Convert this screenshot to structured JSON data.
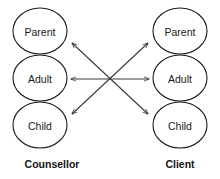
{
  "diagram": {
    "type": "transactional-analysis-ego-state-diagram",
    "background_color": "#ffffff",
    "stroke_color": "#1a1a1a",
    "arrow_color": "#3a3a3a",
    "text_color": "#1a1a1a",
    "parties": [
      {
        "id": "counsellor",
        "label": "Counsellor",
        "label_x": 52,
        "label_y": 164,
        "center_x": 40,
        "ego_states": [
          {
            "id": "counsellor-parent",
            "label": "Parent",
            "cx": 40,
            "cy": 31,
            "rx": 27,
            "ry": 23
          },
          {
            "id": "counsellor-adult",
            "label": "Adult",
            "cx": 40,
            "cy": 78,
            "rx": 27,
            "ry": 23
          },
          {
            "id": "counsellor-child",
            "label": "Child",
            "cx": 40,
            "cy": 125,
            "rx": 27,
            "ry": 23
          }
        ]
      },
      {
        "id": "client",
        "label": "Client",
        "label_x": 180,
        "label_y": 164,
        "center_x": 180,
        "ego_states": [
          {
            "id": "client-parent",
            "label": "Parent",
            "cx": 180,
            "cy": 31,
            "rx": 27,
            "ry": 23
          },
          {
            "id": "client-adult",
            "label": "Adult",
            "cx": 180,
            "cy": 78,
            "rx": 27,
            "ry": 23
          },
          {
            "id": "client-child",
            "label": "Child",
            "cx": 180,
            "cy": 125,
            "rx": 27,
            "ry": 23
          }
        ]
      }
    ],
    "transactions": [
      {
        "id": "counsellor-parent-to-client-child",
        "from": "counsellor-parent",
        "to": "client-child",
        "direction": "both",
        "x1": 72,
        "y1": 43,
        "x2": 148,
        "y2": 114
      },
      {
        "id": "counsellor-adult-to-client-adult",
        "from": "counsellor-adult",
        "to": "client-adult",
        "direction": "both",
        "x1": 71,
        "y1": 79,
        "x2": 149,
        "y2": 79
      },
      {
        "id": "counsellor-child-to-client-parent",
        "from": "counsellor-child",
        "to": "client-parent",
        "direction": "both",
        "x1": 72,
        "y1": 114,
        "x2": 148,
        "y2": 43
      }
    ]
  }
}
